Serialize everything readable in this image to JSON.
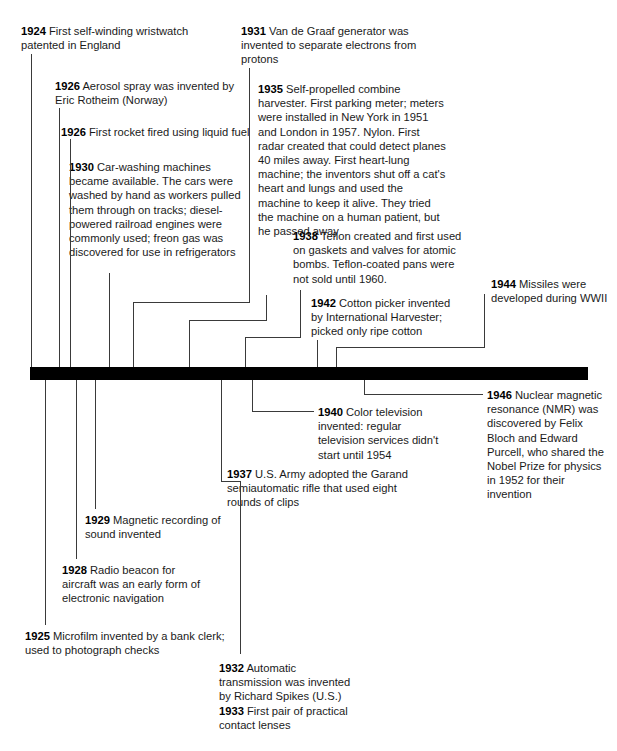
{
  "timeline": {
    "title": "Inventions timeline 1924-1946",
    "bar_color": "#000000",
    "line_color": "#3a3a3a",
    "text_color": "#1a1a1a",
    "range_start": "1924",
    "range_end": "1946"
  },
  "entries": [
    {
      "id": "e1924",
      "year": "1924",
      "text": " First self-winding wristwatch patented in England"
    },
    {
      "id": "e1926a",
      "year": "1926",
      "text": " Aerosol spray was invented by Eric Rotheim (Norway)"
    },
    {
      "id": "e1926b",
      "year": "1926",
      "text": " First rocket fired using liquid fuel"
    },
    {
      "id": "e1930",
      "year": "1930",
      "text": " Car-washing machines became available. The cars were washed by hand as workers pulled them through on tracks; diesel-powered railroad engines were commonly used; freon gas was discovered for use in refrigerators"
    },
    {
      "id": "e1931",
      "year": "1931",
      "text": " Van de Graaf generator was invented to separate electrons from protons"
    },
    {
      "id": "e1935",
      "year": "1935",
      "text": " Self-propelled combine harvester. First parking meter; meters were installed in New York in 1951 and London in 1957. Nylon. First radar created that could detect planes 40 miles away. First heart-lung machine; the inventors shut off a cat's heart and lungs and used the machine to keep it alive. They tried the machine on a human patient, but he passed away"
    },
    {
      "id": "e1938",
      "year": "1938",
      "text": " Teflon created and first used on gaskets and valves for atomic bombs. Teflon-coated pans were not sold until 1960."
    },
    {
      "id": "e1942",
      "year": "1942",
      "text": " Cotton picker invented by International Harvester; picked only ripe cotton"
    },
    {
      "id": "e1944",
      "year": "1944",
      "text": " Missiles were developed during WWII"
    },
    {
      "id": "e1946",
      "year": "1946",
      "text": " Nuclear magnetic resonance (NMR) was discovered by Felix Bloch and Edward Purcell, who shared the Nobel Prize for physics in 1952 for their invention"
    },
    {
      "id": "e1940",
      "year": "1940",
      "text": " Color television invented: regular television services didn't start until 1954"
    },
    {
      "id": "e1937",
      "year": "1937",
      "text": " U.S. Army adopted the Garand semiautomatic rifle that used eight rounds of clips"
    },
    {
      "id": "e1929",
      "year": "1929",
      "text": " Magnetic recording of sound invented"
    },
    {
      "id": "e1928",
      "year": "1928",
      "text": " Radio beacon for aircraft was an early form of electronic navigation"
    },
    {
      "id": "e1925",
      "year": "1925",
      "text": " Microfilm invented by a bank clerk; used to photograph checks"
    },
    {
      "id": "e1932",
      "year": "1932",
      "text": " Automatic transmission was invented by Richard Spikes (U.S.)"
    },
    {
      "id": "e1933",
      "year": "1933",
      "text": " First pair of practical contact lenses"
    }
  ]
}
